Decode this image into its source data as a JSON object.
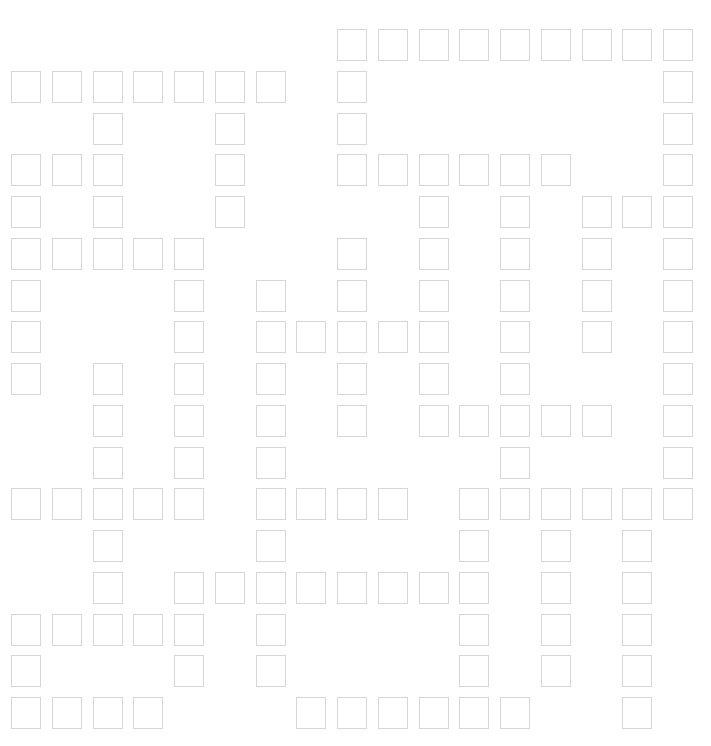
{
  "puzzle": {
    "type": "crossword-grid",
    "columns": 17,
    "rows": 17,
    "cell_border_color": "#d6d6d6",
    "origin": {
      "x": 11,
      "y": 29
    },
    "pitch": {
      "x": 40.75,
      "y": 41.75
    },
    "filled_cells": [
      [
        8,
        9,
        10,
        11,
        12,
        13,
        14,
        15,
        16
      ],
      [
        0,
        1,
        2,
        3,
        4,
        5,
        6,
        8,
        16
      ],
      [
        2,
        5,
        8,
        16
      ],
      [
        0,
        1,
        2,
        5,
        8,
        9,
        10,
        11,
        12,
        13,
        16
      ],
      [
        0,
        2,
        5,
        10,
        12,
        14,
        15,
        16
      ],
      [
        0,
        1,
        2,
        3,
        4,
        8,
        10,
        12,
        14,
        16
      ],
      [
        0,
        4,
        6,
        8,
        10,
        12,
        14,
        16
      ],
      [
        0,
        4,
        6,
        7,
        8,
        9,
        10,
        12,
        14,
        16
      ],
      [
        0,
        2,
        4,
        6,
        8,
        10,
        12,
        16
      ],
      [
        2,
        4,
        6,
        8,
        10,
        11,
        12,
        13,
        14,
        16
      ],
      [
        2,
        4,
        6,
        12,
        16
      ],
      [
        0,
        1,
        2,
        3,
        4,
        6,
        7,
        8,
        9,
        11,
        12,
        13,
        14,
        15,
        16
      ],
      [
        2,
        6,
        11,
        13,
        15
      ],
      [
        2,
        4,
        5,
        6,
        7,
        8,
        9,
        10,
        11,
        13,
        15
      ],
      [
        0,
        1,
        2,
        3,
        4,
        6,
        11,
        13,
        15
      ],
      [
        0,
        4,
        6,
        11,
        13,
        15
      ],
      [
        0,
        1,
        2,
        3,
        7,
        8,
        9,
        10,
        11,
        12,
        15
      ]
    ]
  }
}
